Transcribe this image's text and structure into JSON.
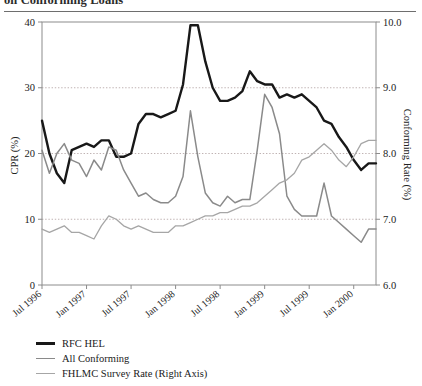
{
  "title": {
    "text": "on Conforming Loans",
    "note": "top of title cropped out of frame"
  },
  "legend": {
    "position": "below-plot",
    "items": [
      {
        "label": "RFC HEL",
        "color": "#181818",
        "width": 2.6,
        "name": "legend-item-rfc-hel"
      },
      {
        "label": "All Conforming",
        "color": "#8a8a8a",
        "width": 1.9,
        "name": "legend-item-all-conforming"
      },
      {
        "label": "FHLMC Survey Rate (Right Axis)",
        "color": "#a6a6a6",
        "width": 1.6,
        "name": "legend-item-fhlmc-survey-rate"
      }
    ]
  },
  "axes": {
    "y_left": {
      "label": "CPR (%)",
      "ticks": [
        "0",
        "10",
        "20",
        "30",
        "40"
      ],
      "min": 0,
      "max": 40
    },
    "y_right": {
      "label": "Conforming Rate (%)",
      "ticks": [
        "6.0",
        "7.0",
        "8.0",
        "9.0",
        "10.0"
      ],
      "min": 6.0,
      "max": 10.0
    },
    "x": {
      "label": "",
      "ticks": [
        "Jul 1996",
        "Jan 1997",
        "Jul 1997",
        "Jan 1998",
        "Jul 1998",
        "Jan 1999",
        "Jul 1999",
        "Jan 2000"
      ]
    }
  },
  "chart_data": {
    "type": "line",
    "title": "on Conforming Loans",
    "xlabel": "",
    "ylabel": "CPR (%)",
    "y2label": "Conforming Rate (%)",
    "ylim": [
      0,
      40
    ],
    "y2lim": [
      6.0,
      10.0
    ],
    "grid": "horizontal dotted at 10, 20, 30 (left axis)",
    "gridlines": [
      10,
      20,
      30
    ],
    "legend_position": "bottom-left",
    "x_tick_labels": [
      "Jul 1996",
      "Jan 1997",
      "Jul 1997",
      "Jan 1998",
      "Jul 1998",
      "Jan 1999",
      "Jul 1999",
      "Jan 2000"
    ],
    "x_months": [
      "Jul 1996",
      "Aug 1996",
      "Sep 1996",
      "Oct 1996",
      "Nov 1996",
      "Dec 1996",
      "Jan 1997",
      "Feb 1997",
      "Mar 1997",
      "Apr 1997",
      "May 1997",
      "Jun 1997",
      "Jul 1997",
      "Aug 1997",
      "Sep 1997",
      "Oct 1997",
      "Nov 1997",
      "Dec 1997",
      "Jan 1998",
      "Feb 1998",
      "Mar 1998",
      "Apr 1998",
      "May 1998",
      "Jun 1998",
      "Jul 1998",
      "Aug 1998",
      "Sep 1998",
      "Oct 1998",
      "Nov 1998",
      "Dec 1998",
      "Jan 1999",
      "Feb 1999",
      "Mar 1999",
      "Apr 1999",
      "May 1999",
      "Jun 1999",
      "Jul 1999",
      "Aug 1999",
      "Sep 1999",
      "Oct 1999",
      "Nov 1999",
      "Dec 1999",
      "Jan 2000",
      "Feb 2000",
      "Mar 2000",
      "Apr 2000"
    ],
    "series": [
      {
        "name": "RFC HEL",
        "axis": "left",
        "color": "#181818",
        "values": [
          25.0,
          20.0,
          17.0,
          15.5,
          20.5,
          21.0,
          21.5,
          21.0,
          22.0,
          22.0,
          19.5,
          19.5,
          20.0,
          24.5,
          26.0,
          26.0,
          25.5,
          26.0,
          26.5,
          30.5,
          39.5,
          39.5,
          34.0,
          30.0,
          28.0,
          28.0,
          28.5,
          29.5,
          32.5,
          31.0,
          30.5,
          30.5,
          28.5,
          29.0,
          28.5,
          29.0,
          28.0,
          27.0,
          25.0,
          24.5,
          22.5,
          21.0,
          19.0,
          17.5,
          18.5,
          18.5
        ]
      },
      {
        "name": "All Conforming",
        "axis": "left",
        "color": "#8a8a8a",
        "values": [
          20.5,
          17.0,
          20.0,
          21.5,
          19.0,
          18.5,
          16.5,
          19.0,
          17.5,
          21.0,
          20.5,
          17.5,
          15.5,
          13.5,
          14.0,
          13.0,
          12.5,
          12.5,
          13.5,
          16.5,
          26.5,
          19.5,
          14.0,
          12.5,
          12.0,
          13.5,
          12.5,
          13.0,
          13.0,
          20.5,
          29.0,
          27.0,
          23.0,
          13.5,
          11.5,
          10.5,
          10.5,
          10.5,
          15.5,
          10.5,
          9.5,
          8.5,
          7.5,
          6.5,
          8.5,
          8.5
        ]
      },
      {
        "name": "FHLMC Survey Rate (Right Axis)",
        "axis": "right",
        "color": "#a6a6a6",
        "values": [
          6.85,
          6.8,
          6.85,
          6.9,
          6.8,
          6.8,
          6.75,
          6.7,
          6.9,
          7.05,
          7.0,
          6.9,
          6.85,
          6.9,
          6.85,
          6.8,
          6.8,
          6.8,
          6.9,
          6.9,
          6.95,
          7.0,
          7.05,
          7.05,
          7.1,
          7.1,
          7.15,
          7.2,
          7.2,
          7.25,
          7.35,
          7.45,
          7.55,
          7.6,
          7.7,
          7.9,
          7.95,
          8.05,
          8.15,
          8.05,
          7.9,
          7.8,
          7.95,
          8.15,
          8.2,
          8.2
        ]
      }
    ]
  },
  "colors": {
    "frame": "#8c8c8c",
    "grid": "#b0a0a0",
    "rfc_hel": "#181818",
    "all_conforming": "#8a8a8a",
    "fhlmc": "#a6a6a6",
    "background": "#ffffff"
  }
}
